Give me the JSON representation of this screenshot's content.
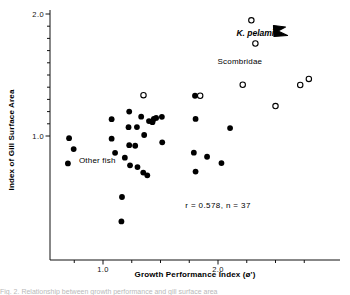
{
  "figure": {
    "caption_fragment": "Fig. 2.   Relationship between growth performance and gill surface area"
  },
  "chart_data": {
    "type": "scatter",
    "title": "",
    "xlabel": "Growth Performance Index (ø')",
    "ylabel": "Index of Gill Surface Area",
    "xlim": [
      0.55,
      2.9
    ],
    "ylim": [
      0.1,
      2.03
    ],
    "xticks": [
      0.75,
      1.0,
      1.25,
      1.5,
      1.75,
      2.0,
      2.25,
      2.5,
      2.75
    ],
    "xticklabels": [
      "",
      "1.0",
      "",
      "",
      "",
      "2.0",
      "",
      "",
      ""
    ],
    "yticks": [
      1.0,
      1.1,
      1.2,
      1.3,
      1.4,
      1.5,
      1.6,
      1.7,
      1.8,
      1.9,
      2.0
    ],
    "yticklabels": [
      "1.0",
      "",
      "",
      "",
      "",
      "",
      "",
      "",
      "",
      "",
      "2.0"
    ],
    "grid": false,
    "legend": false,
    "series": [
      {
        "name": "Other fish",
        "marker": "filled-circle",
        "color": "#000000",
        "points": [
          [
            0.705,
            0.982
          ],
          [
            0.745,
            0.893
          ],
          [
            0.695,
            0.775
          ],
          [
            1.075,
            1.138
          ],
          [
            1.075,
            0.978
          ],
          [
            1.105,
            0.862
          ],
          [
            1.165,
            0.5
          ],
          [
            1.16,
            0.3
          ],
          [
            1.19,
            0.822
          ],
          [
            1.228,
            1.2
          ],
          [
            1.222,
            1.072
          ],
          [
            1.228,
            0.925
          ],
          [
            1.235,
            0.76
          ],
          [
            1.28,
            0.92
          ],
          [
            1.295,
            1.073
          ],
          [
            1.3,
            0.745
          ],
          [
            1.332,
            1.158
          ],
          [
            1.35,
            0.7
          ],
          [
            1.358,
            1.008
          ],
          [
            1.385,
            0.678
          ],
          [
            1.4,
            1.122
          ],
          [
            1.43,
            1.113
          ],
          [
            1.442,
            1.14
          ],
          [
            1.462,
            1.148
          ],
          [
            1.512,
            1.157
          ],
          [
            1.515,
            0.948
          ],
          [
            1.8,
            1.33
          ],
          [
            1.805,
            1.14
          ],
          [
            1.79,
            0.863
          ],
          [
            1.805,
            0.708
          ],
          [
            1.905,
            0.83
          ],
          [
            2.03,
            0.778
          ],
          [
            2.105,
            1.065
          ]
        ]
      },
      {
        "name": "Scombridae",
        "marker": "open-circle",
        "color": "#000000",
        "points": [
          [
            1.352,
            1.335
          ],
          [
            1.845,
            1.33
          ],
          [
            2.215,
            1.42
          ],
          [
            2.29,
            1.948
          ],
          [
            2.325,
            1.758
          ],
          [
            2.5,
            1.245
          ],
          [
            2.715,
            1.418
          ],
          [
            2.79,
            1.468
          ]
        ]
      }
    ],
    "annotations": [
      {
        "id": "other-fish-label",
        "text": "Other fish",
        "x": 0.95,
        "y": 0.775,
        "style": "plain"
      },
      {
        "id": "k-pelamis-label",
        "text": "K. pelamis",
        "x": 2.345,
        "y": 1.82,
        "style": "italic"
      },
      {
        "id": "scombridae-label",
        "text": "Scombridae",
        "x": 2.19,
        "y": 1.59,
        "style": "plain"
      },
      {
        "id": "stats-label",
        "text": "r = 0.578, n = 37",
        "x": 2.0,
        "y": 0.41,
        "style": "stats"
      }
    ],
    "pointer": {
      "id": "k-pelamis-arrow",
      "description": "hooked arrow pointing to K. pelamis open circle"
    },
    "correlation": {
      "r": 0.578,
      "n": 37
    }
  }
}
